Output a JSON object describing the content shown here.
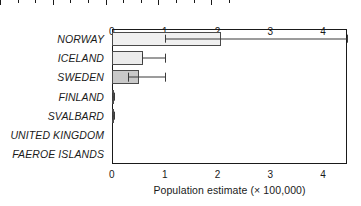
{
  "chart_data": {
    "type": "bar",
    "orientation": "horizontal",
    "title": "",
    "xlabel": "Population estimate (× 100,000)",
    "ylabel": "",
    "xlim": [
      0,
      4.45
    ],
    "xticks": [
      0,
      1,
      2,
      3,
      4
    ],
    "xtick_labels": [
      "0",
      "1",
      "2",
      "3",
      "4"
    ],
    "minor_ticks_per_interval": 2,
    "grid": false,
    "legend": null,
    "axis_top": true,
    "axis_bottom": true,
    "categories": [
      "NORWAY",
      "ICELAND",
      "SWEDEN",
      "FINLAND",
      "SVALBARD",
      "UNITED KINGDOM",
      "FAEROE ISLANDS"
    ],
    "values": [
      2.07,
      0.58,
      0.52,
      0.04,
      0.015,
      0.0,
      0.0
    ],
    "error_low": [
      1.0,
      0.57,
      0.3,
      0.0,
      0.0,
      0.0,
      0.0
    ],
    "error_high": [
      4.45,
      1.0,
      1.0,
      0.04,
      0.03,
      0.0,
      0.0
    ],
    "bar_fills": [
      "#f0f0f0",
      "#ececec",
      "#c9c9c9",
      "#9a9a9a",
      "#9a9a9a",
      "#ffffff",
      "#ffffff"
    ],
    "bar_edge_color": "#4a4a4a",
    "error_color": "#3a3a3a",
    "axis_color": "#1a1a1a",
    "background": "#ffffff"
  }
}
